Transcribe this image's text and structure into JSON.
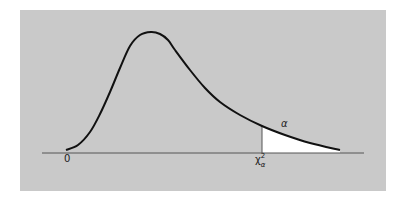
{
  "diagram": {
    "title": "",
    "colors": {
      "panel": "#c9c9c9",
      "curve": "#111111",
      "axis": "#555555",
      "tail_fill": "#ffffff"
    },
    "labels": {
      "origin": "0",
      "tail_area": "α",
      "critical_symbol": "χ",
      "critical_superscript": "2",
      "critical_subscript": "α"
    },
    "curve_points": [
      [
        66,
        150
      ],
      [
        78,
        145
      ],
      [
        90,
        132
      ],
      [
        100,
        114
      ],
      [
        110,
        92
      ],
      [
        120,
        68
      ],
      [
        130,
        46
      ],
      [
        140,
        35
      ],
      [
        151,
        32
      ],
      [
        160,
        34
      ],
      [
        168,
        40
      ],
      [
        175,
        50
      ],
      [
        190,
        70
      ],
      [
        205,
        88
      ],
      [
        220,
        102
      ],
      [
        240,
        115
      ],
      [
        262,
        126
      ],
      [
        285,
        135
      ],
      [
        310,
        143
      ],
      [
        340,
        150
      ]
    ],
    "critical_x": 262,
    "axis": {
      "x1": 42,
      "x2": 364,
      "y": 153
    }
  }
}
